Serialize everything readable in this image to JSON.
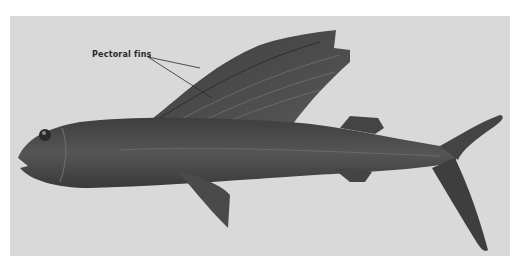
{
  "illustration": {
    "subject": "flying fish",
    "background_color": "#d9d9d9",
    "fish_color": "#4a4a4a",
    "annotation": {
      "label": "Pectoral fins",
      "pointer_count": 2
    }
  }
}
